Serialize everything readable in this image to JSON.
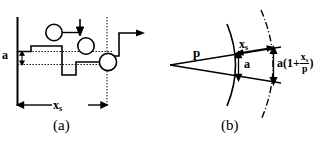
{
  "figure": {
    "kind": "two-panel-line-diagram",
    "background_color": "#ffffff",
    "stroke_color": "#000000",
    "width": 330,
    "height": 147
  },
  "panel_a": {
    "caption": "(a)",
    "amplitude_label": "a",
    "spacing_label_base": "x",
    "spacing_label_sub": "s",
    "description": "stepped staircase profile with circular markers, vertical axis at left, dotted reference lines at amplitude a, dotted vertical line at step spacing, dimension arrow for x_s"
  },
  "panel_b": {
    "caption": "(b)",
    "p_label": "p",
    "xs_label_base": "x",
    "xs_label_sub": "s",
    "a_label": "a",
    "formula": {
      "prefix": "a(1+",
      "numerator_base": "x",
      "numerator_sub": "s",
      "denominator": "p",
      "suffix": ")"
    },
    "description": "wedge from apex with solid arc at distance p and dash-dot arc at distance p + x_s; vertical dimension a at solid arc and a(1+x_s/p) at outer arc"
  }
}
